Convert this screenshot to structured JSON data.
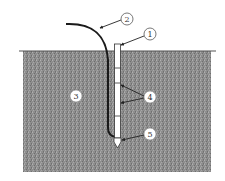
{
  "diagram": {
    "type": "cross-section",
    "ground": {
      "x": 23,
      "y": 51,
      "width": 188,
      "height": 121,
      "fill": "#8c8c8c",
      "surface_line": {
        "x1": 19,
        "x2": 216,
        "y": 51
      }
    },
    "tube": {
      "x": 114.5,
      "y_top": 44,
      "width": 6,
      "y_bottom": 138,
      "ticks_y": [
        68,
        83,
        116
      ]
    },
    "tip": {
      "y_top": 138,
      "y_point": 148
    },
    "cable": {
      "start": [
        66,
        24
      ],
      "vertical_x": 108
    },
    "labels": [
      {
        "id": "1",
        "text": "1",
        "cx": 150,
        "cy": 34,
        "target": [
          121,
          45
        ]
      },
      {
        "id": "2",
        "text": "2",
        "cx": 127,
        "cy": 19,
        "target": [
          99,
          28
        ]
      },
      {
        "id": "3",
        "text": "3",
        "cx": 76,
        "cy": 96
      },
      {
        "id": "4",
        "text": "4",
        "cx": 150,
        "cy": 97,
        "targets": [
          [
            120,
            85
          ],
          [
            120,
            103
          ]
        ]
      },
      {
        "id": "5",
        "text": "5",
        "cx": 150,
        "cy": 134,
        "target": [
          121,
          140
        ]
      }
    ]
  }
}
